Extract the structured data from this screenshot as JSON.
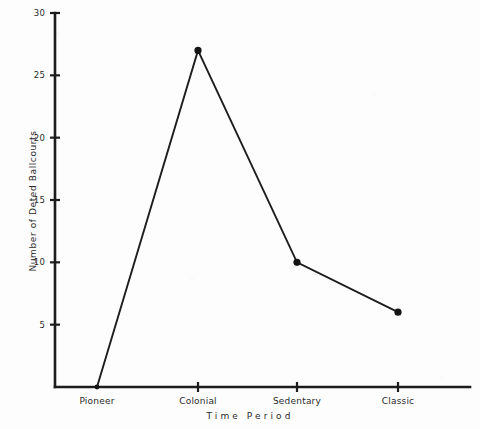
{
  "chart_data": {
    "type": "line",
    "title": "",
    "xlabel": "Time Period",
    "ylabel": "Number of Deted Ballcourts",
    "categories": [
      "Pioneer",
      "Colonial",
      "Sedentary",
      "Classic"
    ],
    "values": [
      0,
      27,
      10,
      6
    ],
    "series": [
      {
        "name": "Dated Ballcourts",
        "values": [
          0,
          27,
          10,
          6
        ]
      }
    ],
    "ylim": [
      0,
      30
    ],
    "ytick_labels": [
      "5",
      "10",
      "15",
      "20",
      "25",
      "30"
    ],
    "ytick_values": [
      5,
      10,
      15,
      20,
      25,
      30
    ],
    "grid": false,
    "legend": false,
    "marker": "filled-circle",
    "line_color": "#1d1d1d",
    "marker_color": "#141414",
    "background_color": "#fdfdfd"
  },
  "axes": {
    "y_axis_name": "y-axis",
    "x_axis_name": "x-axis"
  }
}
